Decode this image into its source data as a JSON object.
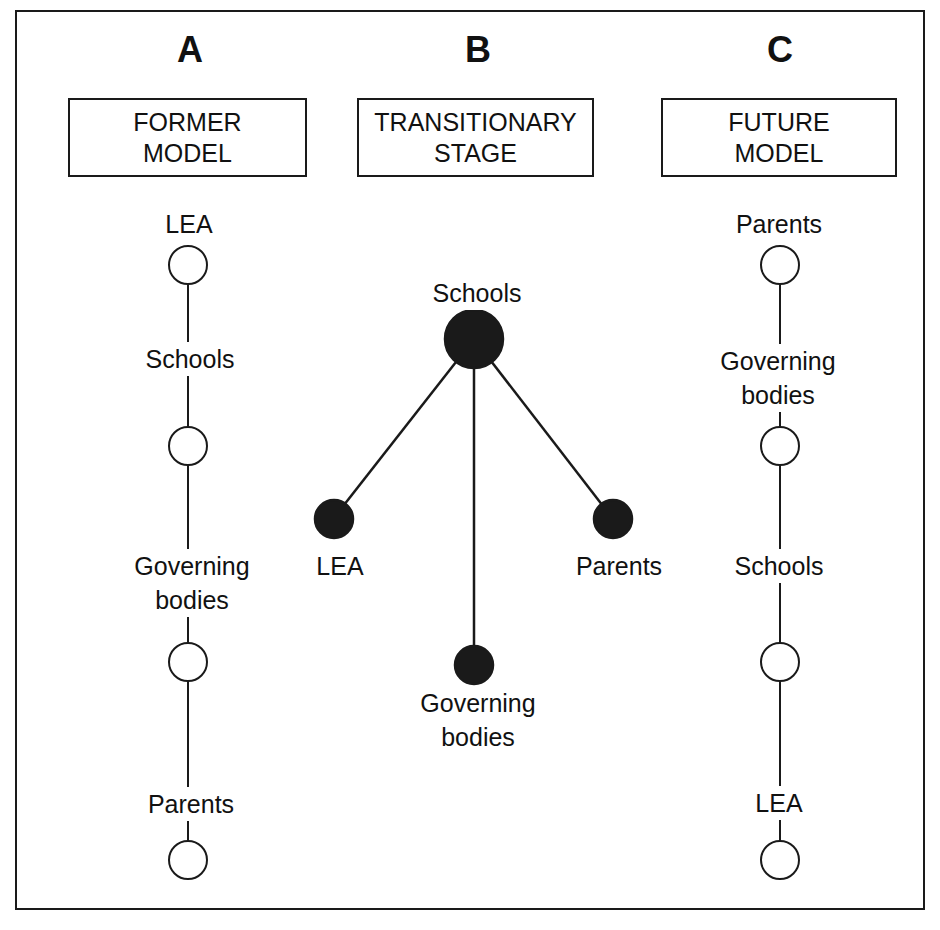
{
  "columns": [
    {
      "letter": "A",
      "title": "FORMER\nMODEL",
      "node_style": "open",
      "nodes": [
        {
          "label": "LEA"
        },
        {
          "label": "Schools"
        },
        {
          "label": "Governing\nbodies"
        },
        {
          "label": "Parents"
        }
      ]
    },
    {
      "letter": "B",
      "title": "TRANSITIONARY\nSTAGE",
      "node_style": "filled",
      "center": {
        "label": "Schools"
      },
      "spokes": [
        {
          "label": "LEA"
        },
        {
          "label": "Governing\nbodies"
        },
        {
          "label": "Parents"
        }
      ]
    },
    {
      "letter": "C",
      "title": "FUTURE\nMODEL",
      "node_style": "open",
      "nodes": [
        {
          "label": "Parents"
        },
        {
          "label": "Governing\nbodies"
        },
        {
          "label": "Schools"
        },
        {
          "label": "LEA"
        }
      ]
    }
  ],
  "colors": {
    "ink": "#1a1a1a",
    "background": "#ffffff"
  }
}
